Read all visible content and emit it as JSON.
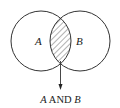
{
  "diagram": {
    "type": "venn",
    "sets": [
      {
        "id": "A",
        "label": "A",
        "cx": 41,
        "cy": 41,
        "r": 30
      },
      {
        "id": "B",
        "label": "B",
        "cx": 80,
        "cy": 41,
        "r": 30
      }
    ],
    "intersection": {
      "shading": "hatched",
      "caption": {
        "left": "A",
        "middle": " AND ",
        "right": "B"
      }
    },
    "colors": {
      "stroke": "#333333",
      "hatch": "#555555",
      "background": "#ffffff"
    }
  }
}
